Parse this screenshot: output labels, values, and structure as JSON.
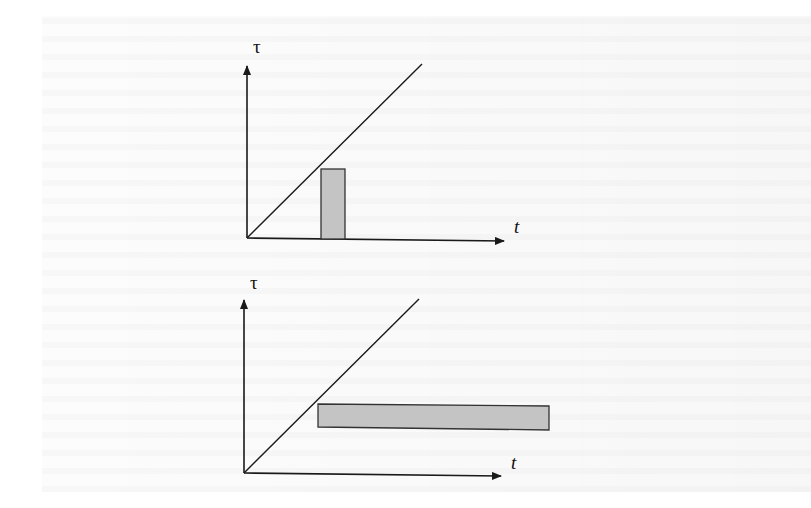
{
  "figure": {
    "panels": [
      {
        "id": "top",
        "y_axis_label": "τ",
        "x_axis_label": "t",
        "origin": [
          247,
          238
        ],
        "y_axis_top": [
          247,
          64
        ],
        "x_axis_end": [
          505,
          241
        ],
        "diagonal_end": [
          422,
          64
        ],
        "diagonal_meaning": "τ = t",
        "region": {
          "x": 321,
          "y": 169,
          "width": 24,
          "height": 70,
          "fill": "#c4c4c4",
          "stroke": "#333333",
          "shape": "narrow vertical strip"
        }
      },
      {
        "id": "bottom",
        "y_axis_label": "τ",
        "x_axis_label": "t",
        "origin": [
          244,
          473
        ],
        "y_axis_top": [
          244,
          298
        ],
        "x_axis_end": [
          502,
          476
        ],
        "diagonal_end": [
          419,
          299
        ],
        "diagonal_meaning": "τ = t",
        "region": {
          "x": 318,
          "y": 405,
          "width": 231,
          "height": 24,
          "fill": "#c4c4c4",
          "stroke": "#333333",
          "shape": "long horizontal strip"
        }
      }
    ],
    "colors": {
      "ink": "#1a1a1a",
      "fill": "#c4c4c4",
      "background": "#ffffff"
    }
  }
}
